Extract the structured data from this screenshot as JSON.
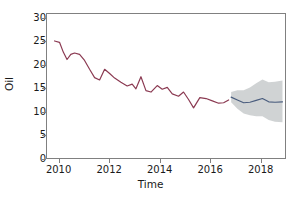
{
  "chart_data": {
    "type": "line",
    "title": "",
    "xlabel": "Time",
    "ylabel": "Oil",
    "xlim": [
      2009.5,
      2019.0
    ],
    "ylim": [
      0,
      31
    ],
    "xticks": [
      2010,
      2012,
      2014,
      2016,
      2018
    ],
    "yticks": [
      0,
      5,
      10,
      15,
      20,
      25,
      30
    ],
    "grid": false,
    "legend": "none",
    "colors": {
      "historical_line": "#8B3A52",
      "forecast_line": "#4A5D7E",
      "forecast_band": "#C8CBCC",
      "axis": "#808080",
      "text": "#1a1a1a",
      "background": "#ffffff"
    },
    "series": [
      {
        "name": "Oil",
        "kind": "historical",
        "color": "#8B3A52",
        "x": [
          2009.8,
          2010.0,
          2010.15,
          2010.3,
          2010.45,
          2010.6,
          2010.8,
          2011.0,
          2011.2,
          2011.4,
          2011.6,
          2011.8,
          2012.0,
          2012.2,
          2012.45,
          2012.7,
          2012.9,
          2013.05,
          2013.25,
          2013.45,
          2013.65,
          2013.9,
          2014.1,
          2014.3,
          2014.5,
          2014.75,
          2014.95,
          2015.15,
          2015.35,
          2015.6,
          2015.85,
          2016.1,
          2016.35,
          2016.55,
          2016.75
        ],
        "y": [
          25.2,
          24.9,
          22.8,
          21.2,
          22.3,
          22.6,
          22.3,
          21.0,
          19.1,
          17.3,
          16.8,
          19.1,
          18.2,
          17.2,
          16.3,
          15.5,
          15.9,
          14.9,
          17.5,
          14.5,
          14.2,
          15.6,
          14.8,
          15.2,
          13.8,
          13.3,
          14.2,
          12.6,
          10.8,
          13.0,
          12.8,
          12.3,
          11.8,
          11.9,
          12.5
        ]
      },
      {
        "name": "Forecast",
        "kind": "forecast",
        "color": "#4A5D7E",
        "x": [
          2016.85,
          2017.1,
          2017.35,
          2017.6,
          2017.85,
          2018.1,
          2018.35,
          2018.6,
          2018.9
        ],
        "y": [
          13.1,
          12.5,
          11.9,
          12.0,
          12.4,
          12.8,
          12.1,
          12.0,
          12.1
        ],
        "band_lower": [
          12.0,
          10.6,
          9.6,
          9.2,
          9.0,
          9.0,
          8.2,
          7.8,
          7.7
        ],
        "band_upper": [
          14.2,
          14.6,
          14.6,
          15.2,
          16.1,
          16.9,
          16.3,
          16.4,
          16.7
        ]
      }
    ]
  }
}
